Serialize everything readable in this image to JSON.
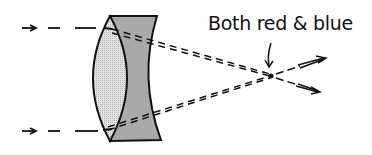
{
  "diagram": {
    "type": "achromatic-doublet-lens",
    "annotation": "Both red & blue",
    "colors": {
      "ink": "#111111",
      "crown_glass_fill": "#d6d6d6",
      "flint_glass_fill": "#a9a9a9"
    },
    "elements": [
      {
        "name": "incoming-ray-top"
      },
      {
        "name": "incoming-ray-bottom"
      },
      {
        "name": "convex-lens"
      },
      {
        "name": "concave-lens"
      },
      {
        "name": "focal-point"
      },
      {
        "name": "outgoing-rays"
      }
    ]
  }
}
